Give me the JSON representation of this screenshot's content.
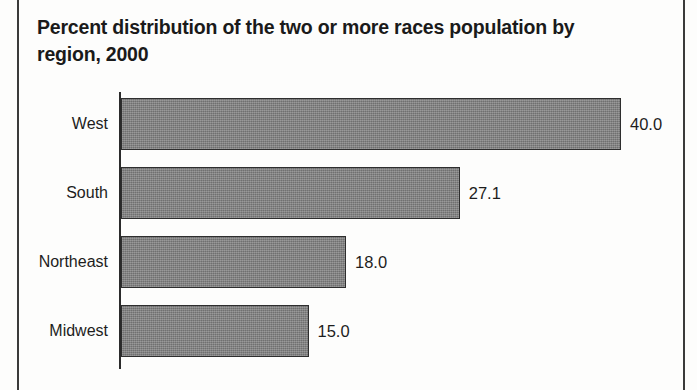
{
  "chart_data": {
    "type": "bar",
    "orientation": "horizontal",
    "title": "Percent distribution of the two or more races population by region, 2000",
    "xlabel": "",
    "ylabel": "",
    "categories": [
      "West",
      "South",
      "Northeast",
      "Midwest"
    ],
    "values": [
      40.0,
      27.1,
      18.0,
      15.0
    ],
    "value_labels": [
      "40.0",
      "27.1",
      "18.0",
      "15.0"
    ],
    "xlim": [
      0,
      40
    ],
    "grid": false,
    "legend": null,
    "series": [
      {
        "name": "Percent distribution",
        "values": [
          40.0,
          27.1,
          18.0,
          15.0
        ]
      }
    ],
    "bar_color": "#7d7d7d",
    "bar_border_color": "#2e2e2e",
    "axis_color": "#2b2b2b",
    "text_color": "#1d1d1d"
  },
  "figure": {
    "background": "#fdfdfc",
    "frame_color": "#3a3a3a"
  }
}
